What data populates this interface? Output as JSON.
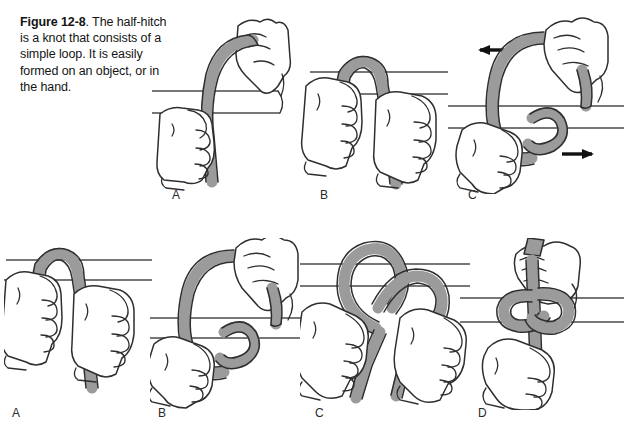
{
  "figure": {
    "number_label": "Figure 12-8",
    "caption_rest": ". The half-hitch is a knot that consists of a simple loop. It is easily formed on an object, or in the hand.",
    "caption_full": "Figure 12-8. The half-hitch is a knot that consists of a simple loop. It is easily formed on an object, or in the hand.",
    "colors": {
      "background": "#ffffff",
      "rope_fill": "#9b9b9b",
      "outline": "#2e2e2e",
      "bar_line": "#4a4a4a",
      "text": "#141414",
      "arrow": "#111111"
    }
  },
  "rows": [
    {
      "row_name": "top-row",
      "panels": [
        {
          "label": "A",
          "description": "Rope arcs over a horizontal bar; upper hand holds the free end, lower hand grips the standing part below the bar.",
          "hands": 2,
          "bar_lines": 2,
          "arrows": []
        },
        {
          "label": "B",
          "description": "Rope has been passed over the bar; both hands hold the two hanging ends below the bar.",
          "hands": 2,
          "bar_lines": 2,
          "arrows": []
        },
        {
          "label": "C",
          "description": "A loop is formed in the rope in front of the bar; arrows show the two ends being pulled in opposite directions.",
          "hands": 2,
          "bar_lines": 2,
          "arrows": [
            "left",
            "right"
          ]
        }
      ]
    },
    {
      "row_name": "bottom-row",
      "panels": [
        {
          "label": "A",
          "description": "Rope draped over the bar with both ends hanging; hands grip each end below the bar.",
          "hands": 2,
          "bar_lines": 2,
          "arrows": []
        },
        {
          "label": "B",
          "description": "A simple loop is formed in front of the bar, upper hand carrying the end around.",
          "hands": 2,
          "bar_lines": 2,
          "arrows": []
        },
        {
          "label": "C",
          "description": "Two crossed loops over the bar as the half-hitch is being shaped by both hands.",
          "hands": 2,
          "bar_lines": 2,
          "arrows": []
        },
        {
          "label": "D",
          "description": "Completed half-hitch drawn tight around the bar; one hand above and one hand below hold the rope.",
          "hands": 2,
          "bar_lines": 2,
          "arrows": []
        }
      ]
    }
  ]
}
